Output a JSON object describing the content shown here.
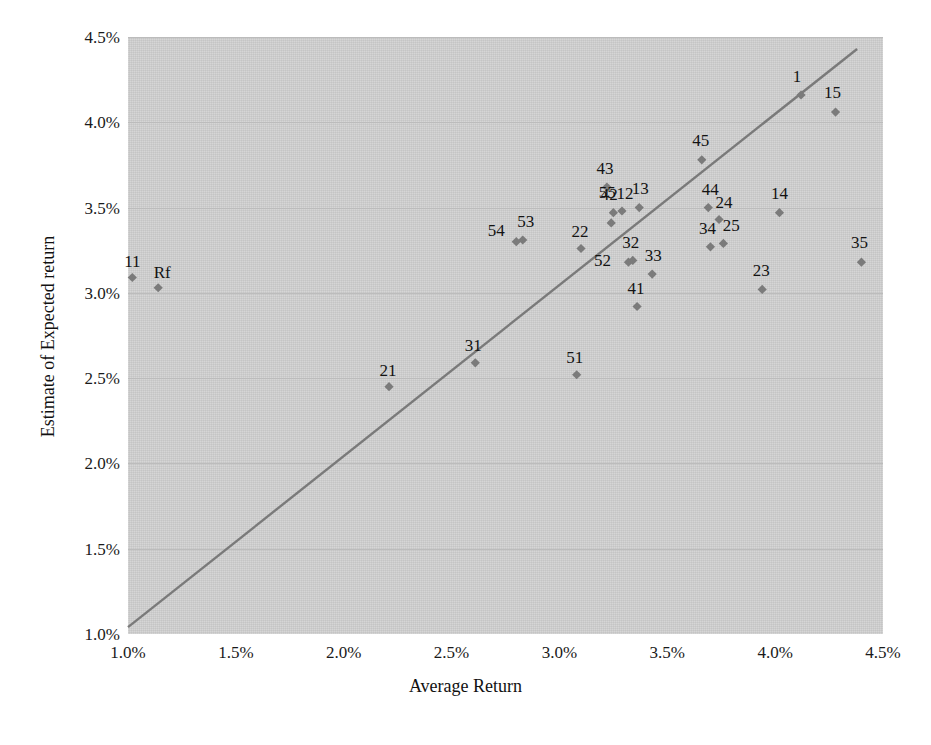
{
  "chart_data": {
    "type": "scatter",
    "title": "",
    "xlabel": "Average Return",
    "ylabel": "Estimate of Expected return",
    "xlim": [
      1.0,
      4.5
    ],
    "ylim": [
      1.0,
      4.5
    ],
    "xticks": [
      "1.0%",
      "1.5%",
      "2.0%",
      "2.5%",
      "3.0%",
      "3.5%",
      "4.0%",
      "4.5%"
    ],
    "xtick_values": [
      1.0,
      1.5,
      2.0,
      2.5,
      3.0,
      3.5,
      4.0,
      4.5
    ],
    "yticks": [
      "1.0%",
      "1.5%",
      "2.0%",
      "2.5%",
      "3.0%",
      "3.5%",
      "4.0%",
      "4.5%"
    ],
    "ytick_values": [
      1.0,
      1.5,
      2.0,
      2.5,
      3.0,
      3.5,
      4.0,
      4.5
    ],
    "grid": "horizontal",
    "legend": "none",
    "plot_background_color": "#d2d2d2",
    "gridline_color": "#bcbcbc",
    "marker_color": "#7b7b7b",
    "marker_shape": "diamond",
    "reference_line": {
      "name": "45-degree identity line",
      "color": "#7a7a7a",
      "x_start": 1.0,
      "y_start": 1.04,
      "x_end": 4.38,
      "y_end": 4.43
    },
    "points": [
      {
        "label": "11",
        "x": 1.02,
        "y": 3.09,
        "label_dx": 0,
        "label_dy": -17
      },
      {
        "label": "Rf",
        "x": 1.14,
        "y": 3.03,
        "label_dx": 4,
        "label_dy": -16
      },
      {
        "label": "21",
        "x": 2.21,
        "y": 2.45,
        "label_dx": -1,
        "label_dy": -17
      },
      {
        "label": "31",
        "x": 2.61,
        "y": 2.59,
        "label_dx": -2,
        "label_dy": -18
      },
      {
        "label": "51",
        "x": 3.08,
        "y": 2.52,
        "label_dx": -2,
        "label_dy": -18
      },
      {
        "label": "54",
        "x": 2.8,
        "y": 3.3,
        "label_dx": -20,
        "label_dy": -12
      },
      {
        "label": "53",
        "x": 2.83,
        "y": 3.31,
        "label_dx": 3,
        "label_dy": -19
      },
      {
        "label": "22",
        "x": 3.1,
        "y": 3.26,
        "label_dx": -1,
        "label_dy": -18
      },
      {
        "label": "55",
        "x": 3.24,
        "y": 3.41,
        "label_dx": -4,
        "label_dy": -31
      },
      {
        "label": "43",
        "x": 3.22,
        "y": 3.62,
        "label_dx": -2,
        "label_dy": -19
      },
      {
        "label": "42",
        "x": 3.25,
        "y": 3.47,
        "label_dx": -4,
        "label_dy": -19
      },
      {
        "label": "12",
        "x": 3.29,
        "y": 3.48,
        "label_dx": 3,
        "label_dy": -18
      },
      {
        "label": "13",
        "x": 3.37,
        "y": 3.5,
        "label_dx": 1,
        "label_dy": -20
      },
      {
        "label": "32",
        "x": 3.34,
        "y": 3.19,
        "label_dx": -2,
        "label_dy": -18
      },
      {
        "label": "52",
        "x": 3.32,
        "y": 3.18,
        "label_dx": -26,
        "label_dy": -2
      },
      {
        "label": "33",
        "x": 3.43,
        "y": 3.11,
        "label_dx": 1,
        "label_dy": -19
      },
      {
        "label": "41",
        "x": 3.36,
        "y": 2.92,
        "label_dx": -1,
        "label_dy": -19
      },
      {
        "label": "45",
        "x": 3.66,
        "y": 3.78,
        "label_dx": -1,
        "label_dy": -20
      },
      {
        "label": "44",
        "x": 3.69,
        "y": 3.5,
        "label_dx": 2,
        "label_dy": -19
      },
      {
        "label": "24",
        "x": 3.74,
        "y": 3.43,
        "label_dx": 5,
        "label_dy": -18
      },
      {
        "label": "34",
        "x": 3.7,
        "y": 3.27,
        "label_dx": -3,
        "label_dy": -19
      },
      {
        "label": "25",
        "x": 3.76,
        "y": 3.29,
        "label_dx": 8,
        "label_dy": -18
      },
      {
        "label": "23",
        "x": 3.94,
        "y": 3.02,
        "label_dx": -1,
        "label_dy": -19
      },
      {
        "label": "14",
        "x": 4.02,
        "y": 3.47,
        "label_dx": 0,
        "label_dy": -20
      },
      {
        "label": "1",
        "x": 4.12,
        "y": 4.16,
        "label_dx": -4,
        "label_dy": -19
      },
      {
        "label": "15",
        "x": 4.28,
        "y": 4.06,
        "label_dx": -3,
        "label_dy": -20
      },
      {
        "label": "35",
        "x": 4.4,
        "y": 3.18,
        "label_dx": -2,
        "label_dy": -20
      }
    ]
  }
}
